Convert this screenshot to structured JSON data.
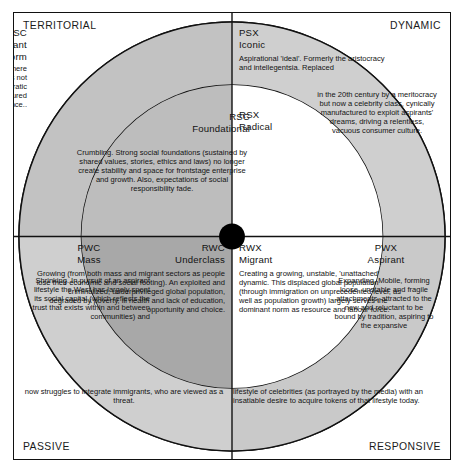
{
  "axes": {
    "top_left": "TERRITORIAL",
    "top_right": "DYNAMIC",
    "bottom_left": "PASSIVE",
    "bottom_right": "RESPONSIVE"
  },
  "colors": {
    "outer_ring": "#c9c9c9",
    "mid_ring": "#b4b4b4",
    "inner_white": "#ffffff",
    "inner_dark": "#a8a8a8",
    "corner_white": "#ffffff",
    "stroke": "#111111",
    "center_dot": "#000000",
    "text": "#131313"
  },
  "regions": {
    "psc": {
      "code": "PSC",
      "name": "Dominant\nnorm",
      "body": "Defining criteria of success and controlling where power is lodged. Demands conformity and does not tolerate diversity. Currently imposes corporatocratic standards and values, based on measured performance.."
    },
    "rsc": {
      "code": "RSC",
      "name": "Foundational",
      "body": "Crumbling. Strong social foundations (sustained by shared values, stories, ethics and laws) no longer create stability and space for frontstage enterprise and growth. Also, expectations of social responsibility fade."
    },
    "psx": {
      "code": "PSX",
      "name": "Iconic",
      "body": "Aspirational 'ideal'. Formerly the aristocracy and intellegentsia. Replaced",
      "body_tail": "in the 20th century by a meritocracy but now a celebrity class, cynically manufactured to exploit aspirants' dreams, driving a relentless, vacuous consumer culture."
    },
    "rsx": {
      "code": "RSX",
      "name": "Radical",
      "body": ""
    },
    "pwc": {
      "code": "PWC",
      "name": "Mass",
      "body": "Shrinking. In pursuit of an aspirant lifestyle the West has largely spent its social capital (which reflects the trust that exists within and between communities) and"
    },
    "rwc": {
      "code": "RWC",
      "name": "Underclass",
      "body": "Growing (from both mass and migrant sectors as people lose their economic and social footing). An exploited and criminalized, underprivileged global population, degraded by poverty, ill health and lack of education, opportunity and choice.",
      "body_tail": "now struggles to integrate immigrants, who are viewed as a threat."
    },
    "rwx": {
      "code": "RWX",
      "name": "Migrant",
      "body": "Creating a growing, unstable, 'unattached' dynamic. This displaced global population (through immigration on unprecedented level, as well as population growth) largely serves the dominant norm as resource and labour force.",
      "body_tail": "lifestyle of celebrities (as portrayed by the media) with an insatiable desire to acquire tokens of that lifestyle today."
    },
    "pwx": {
      "code": "PWX",
      "name": "Aspirant",
      "body": "Expanding. Mobile, forming loose, unstable and fragile attachments, attracted to the new and reluctant to be bound by tradition, aspiring to the expansive"
    }
  }
}
